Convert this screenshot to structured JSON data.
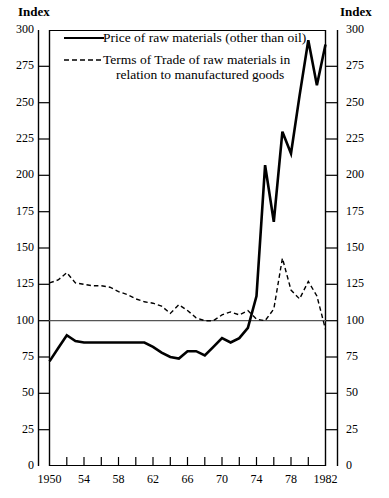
{
  "axis_caption_left": "Index",
  "axis_caption_right": "Index",
  "legend": {
    "series1_label": "Price of raw materials (other than oil)",
    "series2_label_line1": "Terms of Trade of raw materials in",
    "series2_label_line2": "relation to manufactured goods"
  },
  "colors": {
    "line": "#000000",
    "axis": "#000000",
    "background": "#ffffff"
  },
  "chart_data": {
    "type": "line",
    "title": "",
    "subtitle": "",
    "xlabel": "",
    "ylabel": "Index",
    "ylabel_right": "Index",
    "xlim": [
      1950,
      1982
    ],
    "ylim": [
      0,
      300
    ],
    "ytick_labels": [
      "0",
      "25",
      "50",
      "75",
      "100",
      "125",
      "150",
      "175",
      "200",
      "225",
      "250",
      "275",
      "300"
    ],
    "ytick_values": [
      0,
      25,
      50,
      75,
      100,
      125,
      150,
      175,
      200,
      225,
      250,
      275,
      300
    ],
    "xtick_labels": [
      "1950",
      "54",
      "58",
      "62",
      "66",
      "70",
      "74",
      "78",
      "1982"
    ],
    "xtick_values": [
      1950,
      1954,
      1958,
      1962,
      1966,
      1970,
      1974,
      1978,
      1982
    ],
    "xminor_step": 2,
    "grid": false,
    "reference_line": 100,
    "legend_position": "top-left",
    "x": [
      1950,
      1951,
      1952,
      1953,
      1954,
      1955,
      1956,
      1957,
      1958,
      1959,
      1960,
      1961,
      1962,
      1963,
      1964,
      1965,
      1966,
      1967,
      1968,
      1969,
      1970,
      1971,
      1972,
      1973,
      1974,
      1975,
      1976,
      1977,
      1978,
      1979,
      1980,
      1981,
      1982
    ],
    "series": [
      {
        "name": "Price of raw materials (other than oil)",
        "style": "solid",
        "values": [
          72,
          81,
          90,
          86,
          85,
          85,
          85,
          85,
          85,
          85,
          85,
          85,
          82,
          78,
          75,
          74,
          79,
          79,
          76,
          82,
          88,
          85,
          88,
          95,
          117,
          207,
          168,
          230,
          215,
          255,
          293,
          262,
          290
        ]
      },
      {
        "name": "Terms of Trade of raw materials in relation to manufactured goods",
        "style": "dashed",
        "values": [
          126,
          128,
          133,
          126,
          125,
          124,
          124,
          123,
          120,
          118,
          115,
          113,
          112,
          110,
          105,
          111,
          107,
          102,
          100,
          100,
          104,
          106,
          104,
          107,
          101,
          100,
          108,
          143,
          121,
          115,
          127,
          117,
          94
        ]
      }
    ]
  }
}
